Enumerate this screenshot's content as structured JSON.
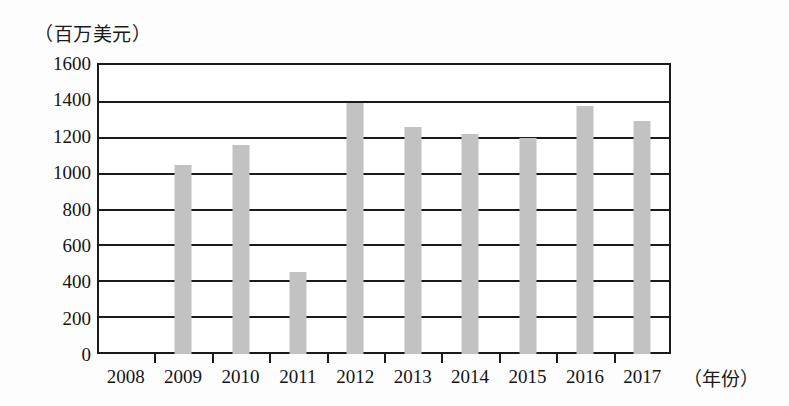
{
  "chart_data": {
    "type": "bar",
    "title": "",
    "subtitle": "",
    "unit_caption": "（百万美元）",
    "xlabel": "（年份）",
    "ylabel": "",
    "categories": [
      "2008",
      "2009",
      "2010",
      "2011",
      "2012",
      "2013",
      "2014",
      "2015",
      "2016",
      "2017"
    ],
    "values": [
      0,
      1040,
      1150,
      450,
      1380,
      1250,
      1210,
      1185,
      1365,
      1280
    ],
    "series": [
      {
        "name": "",
        "values": [
          0,
          1040,
          1150,
          450,
          1380,
          1250,
          1210,
          1185,
          1365,
          1280
        ]
      }
    ],
    "ylim": [
      0,
      1600
    ],
    "ytick_labels": [
      "1600",
      "1400",
      "1200",
      "1000",
      "800",
      "600",
      "400",
      "200",
      "0"
    ],
    "ytick_values": [
      1600,
      1400,
      1200,
      1000,
      800,
      600,
      400,
      200,
      0
    ],
    "grid": true,
    "grid_axis": "y",
    "legend": false,
    "legend_position": "none",
    "bar_color": "#c2c2c2",
    "axis_color": "#1a1a1a",
    "background_color": "#fdfdfd",
    "annotations": []
  }
}
